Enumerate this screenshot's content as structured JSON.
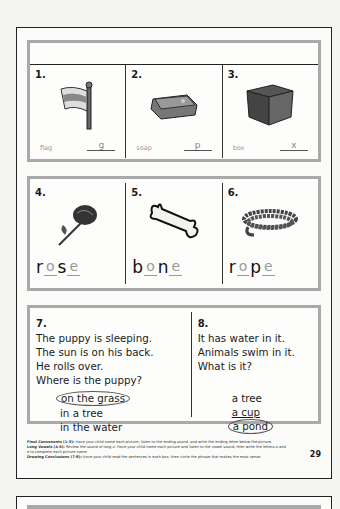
{
  "section1": {
    "items": [
      {
        "number": "1.",
        "word": "flag",
        "answer": "g",
        "icon": "flag-icon"
      },
      {
        "number": "2.",
        "word": "soap",
        "answer": "p",
        "icon": "soap-icon"
      },
      {
        "number": "3.",
        "word": "box",
        "answer": "x",
        "icon": "box-icon"
      }
    ]
  },
  "section2": {
    "items": [
      {
        "number": "4.",
        "letters": [
          {
            "ch": "r",
            "type": "c"
          },
          {
            "ch": "o",
            "type": "v"
          },
          {
            "ch": "s",
            "type": "c"
          },
          {
            "ch": "e",
            "type": "v"
          }
        ],
        "icon": "rose-icon"
      },
      {
        "number": "5.",
        "letters": [
          {
            "ch": "b",
            "type": "c"
          },
          {
            "ch": "o",
            "type": "v"
          },
          {
            "ch": "n",
            "type": "c"
          },
          {
            "ch": "e",
            "type": "v"
          }
        ],
        "icon": "bone-icon"
      },
      {
        "number": "6.",
        "letters": [
          {
            "ch": "r",
            "type": "c"
          },
          {
            "ch": "o",
            "type": "v"
          },
          {
            "ch": "p",
            "type": "c"
          },
          {
            "ch": "e",
            "type": "v"
          }
        ],
        "icon": "rope-icon"
      }
    ]
  },
  "section3": {
    "left": {
      "number": "7.",
      "lines": [
        "The puppy is sleeping.",
        "The sun is on his back.",
        "He rolls over.",
        "Where is the puppy?"
      ],
      "options": [
        "on the grass",
        "in a tree",
        "in the water"
      ],
      "circled_index": 0
    },
    "right": {
      "number": "8.",
      "lines": [
        "It has water in it.",
        "Animals swim in it.",
        "What is it?"
      ],
      "options": [
        "a tree",
        "a cup",
        "a pond"
      ],
      "circled_index": 2
    }
  },
  "footer": {
    "lines": [
      {
        "label": "Final Consonants (1-3):",
        "text": " Have your child name each picture, listen to the ending sound, and write the ending letter below the picture."
      },
      {
        "label": "Long Vowels (4-6):",
        "text": " Review the sound of long o. Have your child name each picture and listen to the vowel sound, then write the letters o and e to complete each picture name."
      },
      {
        "label": "Drawing Conclusions (7-8):",
        "text": " Have your child read the sentences in each box, then circle the phrase that makes the most sense."
      }
    ],
    "page_number": "29"
  }
}
